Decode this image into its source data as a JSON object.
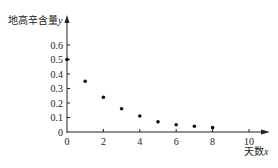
{
  "chart_data": {
    "type": "scatter",
    "title": "",
    "ylabel": "地高辛含量y",
    "xlabel": "天数x",
    "ylabel_text": "地高辛含量",
    "ylabel_var": "y",
    "xlabel_text": "天数",
    "xlabel_var": "x",
    "x": [
      0,
      1,
      2,
      3,
      4,
      5,
      6,
      7,
      8
    ],
    "y": [
      0.5,
      0.35,
      0.24,
      0.16,
      0.11,
      0.07,
      0.05,
      0.04,
      0.03
    ],
    "xlim": [
      0,
      10.5
    ],
    "ylim": [
      0,
      0.7
    ],
    "xticks": [
      "0",
      "2",
      "4",
      "6",
      "8",
      "10"
    ],
    "yticks": [
      "0",
      "0.1",
      "0.2",
      "0.3",
      "0.4",
      "0.5",
      "0.6"
    ],
    "grid": false,
    "legend": null
  }
}
